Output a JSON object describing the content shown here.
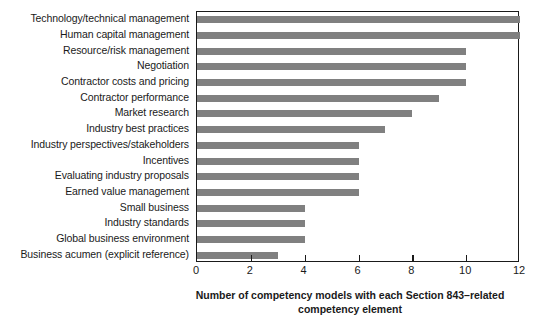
{
  "chart_data": {
    "type": "bar",
    "orientation": "horizontal",
    "title": "",
    "xlabel": "Number of competency models with each Section 843–related competency element",
    "xlabel_lines": [
      "Number of competency models with each Section 843–related",
      "competency element"
    ],
    "ylabel": "",
    "categories": [
      "Technology/technical management",
      "Human capital management",
      "Resource/risk management",
      "Negotiation",
      "Contractor costs and pricing",
      "Contractor performance",
      "Market research",
      "Industry best practices",
      "Industry perspectives/stakeholders",
      "Incentives",
      "Evaluating industry proposals",
      "Earned value management",
      "Small business",
      "Industry standards",
      "Global business environment",
      "Business acumen (explicit reference)"
    ],
    "values": [
      12,
      12,
      10,
      10,
      10,
      9,
      8,
      7,
      6,
      6,
      6,
      6,
      4,
      4,
      4,
      3
    ],
    "xlim": [
      0,
      12
    ],
    "xticks": [
      0,
      2,
      4,
      6,
      8,
      10,
      12
    ],
    "xtick_labels": [
      "0",
      "2",
      "4",
      "6",
      "8",
      "10",
      "12"
    ],
    "grid": false,
    "legend": null,
    "bar_color": "#808080",
    "axis_color": "#1a1a1a",
    "background_color": "#ffffff"
  }
}
